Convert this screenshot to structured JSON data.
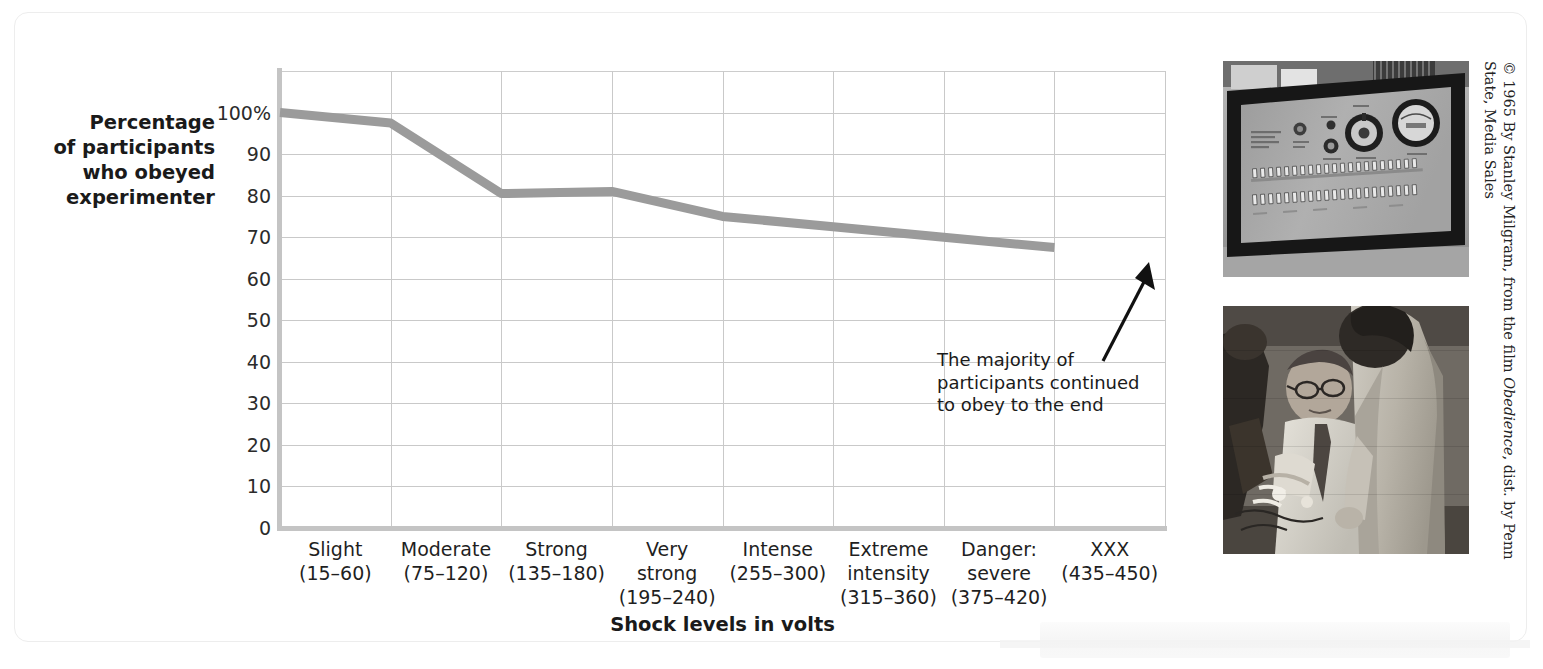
{
  "chart_data": {
    "type": "line",
    "title": "",
    "xlabel": "Shock levels in volts",
    "ylabel": "Percentage of participants who obeyed experimenter",
    "categories": [
      "Slight (15–60)",
      "Moderate (75–120)",
      "Strong (135–180)",
      "Very strong (195–240)",
      "Intense (255–300)",
      "Extreme intensity (315–360)",
      "Danger: severe (375–420)",
      "XXX (435–450)"
    ],
    "values": [
      100,
      97.5,
      80.5,
      81,
      75,
      72.5,
      70,
      67.5
    ],
    "ylim": [
      0,
      110
    ],
    "ytick_values": [
      0,
      10,
      20,
      30,
      40,
      50,
      60,
      70,
      80,
      90,
      100
    ],
    "grid": "both",
    "legend_position": "none",
    "line_color": "#9b9b9b",
    "line_width_px": 9,
    "annotations": [
      "The majority of participants continued to obey to the end"
    ]
  },
  "axis": {
    "y_title_lines": [
      "Percentage",
      "of participants",
      "who obeyed",
      "experimenter"
    ],
    "y_ticks": [
      {
        "label": "100%",
        "value": 100
      },
      {
        "label": "90",
        "value": 90
      },
      {
        "label": "80",
        "value": 80
      },
      {
        "label": "70",
        "value": 70
      },
      {
        "label": "60",
        "value": 60
      },
      {
        "label": "50",
        "value": 50
      },
      {
        "label": "40",
        "value": 40
      },
      {
        "label": "30",
        "value": 30
      },
      {
        "label": "20",
        "value": 20
      },
      {
        "label": "10",
        "value": 10
      },
      {
        "label": "0",
        "value": 0
      }
    ],
    "x_ticks": [
      {
        "line1": "Slight",
        "line2": "(15–60)"
      },
      {
        "line1": "Moderate",
        "line2": "(75–120)"
      },
      {
        "line1": "Strong",
        "line2": "(135–180)"
      },
      {
        "line1": "Very",
        "line2": "strong",
        "line3": "(195–240)"
      },
      {
        "line1": "Intense",
        "line2": "(255–300)"
      },
      {
        "line1": "Extreme",
        "line2": "intensity",
        "line3": "(315–360)"
      },
      {
        "line1": "Danger:",
        "line2": "severe",
        "line3": "(375–420)"
      },
      {
        "line1": "XXX",
        "line2": "(435–450)"
      }
    ],
    "x_title": "Shock levels in volts"
  },
  "annotation": {
    "lines": [
      "The majority of",
      "participants continued",
      "to obey to the end"
    ],
    "text": "The majority of participants continued to obey to the end"
  },
  "photos": [
    {
      "name": "shock-generator-photo",
      "description": "Black and white photograph of the Milgram shock generator control panel with dials, a round meter and two rows of toggle switches, mounted in a dark case"
    },
    {
      "name": "learner-electrodes-photo",
      "description": "Black and white photograph of the seated learner in glasses and tie having electrodes strapped to his arm by two men in lab coats"
    }
  ],
  "credit": {
    "prefix": "© 1965 By Stanley Milgram, from the film ",
    "italic": "Obedience",
    "suffix": ", dist. by Penn State, Media Sales",
    "full": "© 1965 By Stanley Milgram, from the film Obedience, dist. by Penn State, Media Sales"
  }
}
